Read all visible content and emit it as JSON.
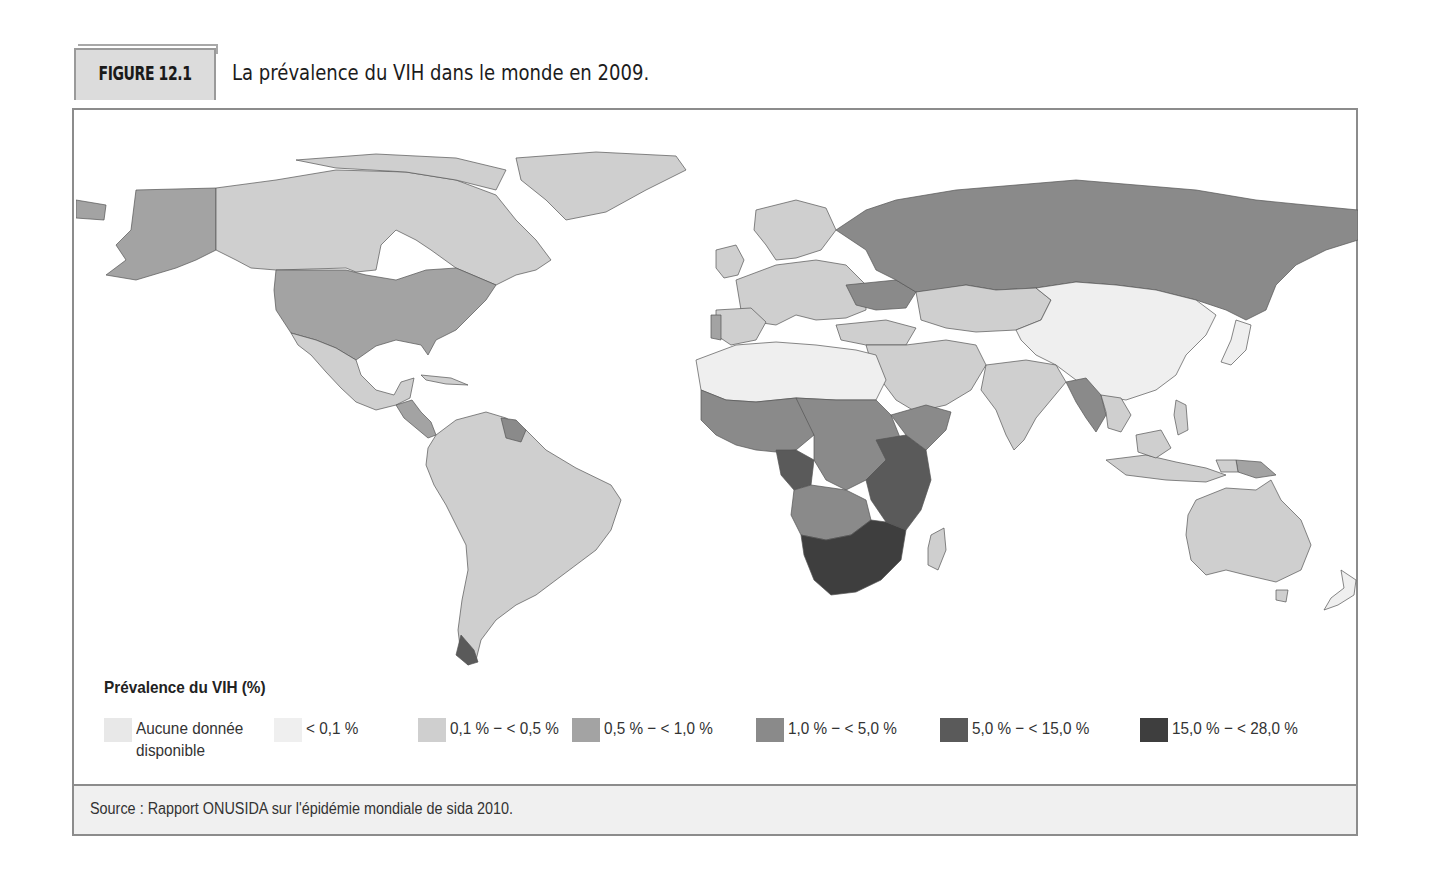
{
  "figure": {
    "label": "FIGURE 12.1",
    "title": "La prévalence du VIH dans le monde en 2009."
  },
  "legend": {
    "title": "Prévalence du VIH (%)",
    "items": [
      {
        "label_line1": "Aucune donnée",
        "label_line2": "disponible",
        "color": "#e8e8e8"
      },
      {
        "label_line1": "< 0,1 %",
        "label_line2": "",
        "color": "#efefef"
      },
      {
        "label_line1": "0,1 % − < 0,5 %",
        "label_line2": "",
        "color": "#cfcfcf"
      },
      {
        "label_line1": "0,5 % − < 1,0 %",
        "label_line2": "",
        "color": "#a3a3a3"
      },
      {
        "label_line1": "1,0 % − < 5,0 %",
        "label_line2": "",
        "color": "#8a8a8a"
      },
      {
        "label_line1": "5,0 % − < 15,0 %",
        "label_line2": "",
        "color": "#5a5a5a"
      },
      {
        "label_line1": "15,0 % − < 28,0 %",
        "label_line2": "",
        "color": "#3e3e3e"
      }
    ]
  },
  "source": {
    "text": "Source : Rapport ONUSIDA sur l'épidémie mondiale de sida 2010."
  },
  "map": {
    "type": "choropleth",
    "variable": "Prévalence du VIH (%)",
    "year": "2009",
    "regions": [
      {
        "name": "Alaska / États-Unis",
        "class": "0,5 % − < 1,0 %"
      },
      {
        "name": "Canada",
        "class": "0,1 % − < 0,5 %"
      },
      {
        "name": "Groenland",
        "class": "0,1 % − < 0,5 %"
      },
      {
        "name": "Mexique",
        "class": "0,1 % − < 0,5 %"
      },
      {
        "name": "Amérique centrale",
        "class": "0,5 % − < 1,0 %"
      },
      {
        "name": "Amérique du Sud",
        "class": "0,1 % − < 0,5 %"
      },
      {
        "name": "Guyane / Suriname",
        "class": "1,0 % − < 5,0 %"
      },
      {
        "name": "Europe de l'Ouest",
        "class": "0,1 % − < 0,5 %"
      },
      {
        "name": "Portugal",
        "class": "0,5 % − < 1,0 %"
      },
      {
        "name": "Russie",
        "class": "1,0 % − < 5,0 %"
      },
      {
        "name": "Ukraine",
        "class": "1,0 % − < 5,0 %"
      },
      {
        "name": "Afrique du Nord",
        "class": "< 0,1 %"
      },
      {
        "name": "Moyen-Orient",
        "class": "0,1 % − < 0,5 %"
      },
      {
        "name": "Afrique de l'Ouest",
        "class": "1,0 % − < 5,0 %"
      },
      {
        "name": "Afrique centrale",
        "class": "1,0 % − < 5,0 %"
      },
      {
        "name": "Cameroun / Gabon",
        "class": "5,0 % − < 15,0 %"
      },
      {
        "name": "Afrique de l'Est",
        "class": "5,0 % − < 15,0 %"
      },
      {
        "name": "Afrique australe",
        "class": "15,0 % − < 28,0 %"
      },
      {
        "name": "Madagascar",
        "class": "0,1 % − < 0,5 %"
      },
      {
        "name": "Asie centrale",
        "class": "0,1 % − < 0,5 %"
      },
      {
        "name": "Chine / Mongolie",
        "class": "< 0,1 %"
      },
      {
        "name": "Inde",
        "class": "0,1 % − < 0,5 %"
      },
      {
        "name": "Myanmar / Thaïlande",
        "class": "1,0 % − < 5,0 %"
      },
      {
        "name": "Asie du Sud-Est",
        "class": "0,1 % − < 0,5 %"
      },
      {
        "name": "Papouasie-Nouvelle-Guinée",
        "class": "0,5 % − < 1,0 %"
      },
      {
        "name": "Australie",
        "class": "0,1 % − < 0,5 %"
      },
      {
        "name": "Nouvelle-Zélande",
        "class": "< 0,1 %"
      },
      {
        "name": "Japon",
        "class": "< 0,1 %"
      }
    ]
  }
}
